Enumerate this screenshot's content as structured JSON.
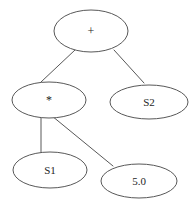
{
  "diagram": {
    "type": "expression-tree",
    "background_color": "#ffffff",
    "stroke_color": "#585858",
    "text_color": "#1e1e1e",
    "nodes": [
      {
        "id": "plus",
        "label": "+",
        "cx": 91,
        "cy": 31,
        "rx": 37,
        "ry": 21
      },
      {
        "id": "times",
        "label": "*",
        "cx": 49,
        "cy": 100,
        "rx": 37,
        "ry": 18
      },
      {
        "id": "s2",
        "label": "S2",
        "cx": 149,
        "cy": 102,
        "rx": 39,
        "ry": 17
      },
      {
        "id": "s1",
        "label": "S1",
        "cx": 50,
        "cy": 170,
        "rx": 37,
        "ry": 18
      },
      {
        "id": "five",
        "label": "5.0",
        "cx": 139,
        "cy": 181,
        "rx": 38,
        "ry": 17
      }
    ],
    "edges": [
      {
        "id": "plus-times",
        "from": "plus",
        "to": "times",
        "x1": 75,
        "y1": 50,
        "x2": 41,
        "y2": 82
      },
      {
        "id": "plus-s2",
        "from": "plus",
        "to": "s2",
        "x1": 114,
        "y1": 50,
        "x2": 144,
        "y2": 83
      },
      {
        "id": "times-s1",
        "from": "times",
        "to": "s1",
        "x1": 41,
        "y1": 117,
        "x2": 41,
        "y2": 154
      },
      {
        "id": "times-five",
        "from": "times",
        "to": "five",
        "x1": 52,
        "y1": 116,
        "x2": 113,
        "y2": 166
      }
    ]
  }
}
